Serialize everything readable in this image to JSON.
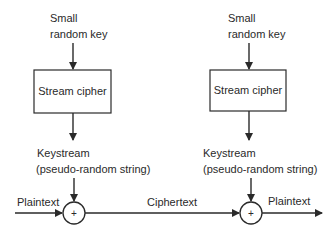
{
  "diagram": {
    "left": {
      "key_label_line1": "Small",
      "key_label_line2": "random key",
      "cipher_box_label": "Stream cipher",
      "keystream_line1": "Keystream",
      "keystream_line2": "(pseudo-random string)",
      "xor_symbol": "+"
    },
    "right": {
      "key_label_line1": "Small",
      "key_label_line2": "random key",
      "cipher_box_label": "Stream cipher",
      "keystream_line1": "Keystream",
      "keystream_line2": "(pseudo-random string)",
      "xor_symbol": "+"
    },
    "flow": {
      "input_label": "Plaintext",
      "middle_label": "Ciphertext",
      "output_label": "Plaintext"
    },
    "colors": {
      "stroke": "#2a2a2a",
      "background": "#ffffff"
    }
  }
}
